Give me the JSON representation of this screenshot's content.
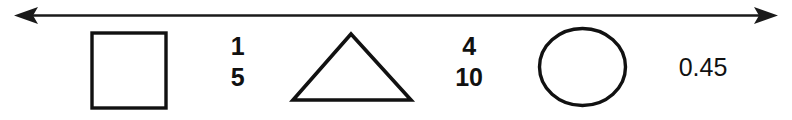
{
  "diagram": {
    "background_color": "#ffffff",
    "ink_color": "#111111",
    "number_line": {
      "icon": "double-headed-arrow-icon",
      "left_arrowhead": "left-arrowhead-icon",
      "right_arrowhead": "right-arrowhead-icon"
    },
    "items": [
      {
        "kind": "shape",
        "name": "square",
        "icon": "square-outline-icon",
        "label": ""
      },
      {
        "kind": "fraction",
        "name": "one-fifth",
        "numerator": "1",
        "denominator": "5",
        "label": "1/5"
      },
      {
        "kind": "shape",
        "name": "triangle",
        "icon": "triangle-outline-icon",
        "label": ""
      },
      {
        "kind": "fraction",
        "name": "four-tenths",
        "numerator": "4",
        "denominator": "10",
        "label": "4/10"
      },
      {
        "kind": "shape",
        "name": "circle",
        "icon": "circle-outline-icon",
        "label": ""
      },
      {
        "kind": "decimal",
        "name": "decimal-zero-point-four-five",
        "value": "0.45"
      }
    ]
  }
}
